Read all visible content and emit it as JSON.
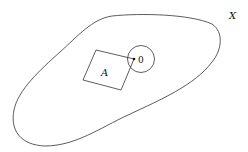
{
  "labels": {
    "space": "X",
    "set": "A",
    "point": "0"
  },
  "colors": {
    "stroke": "#333333",
    "text": "#111111"
  }
}
